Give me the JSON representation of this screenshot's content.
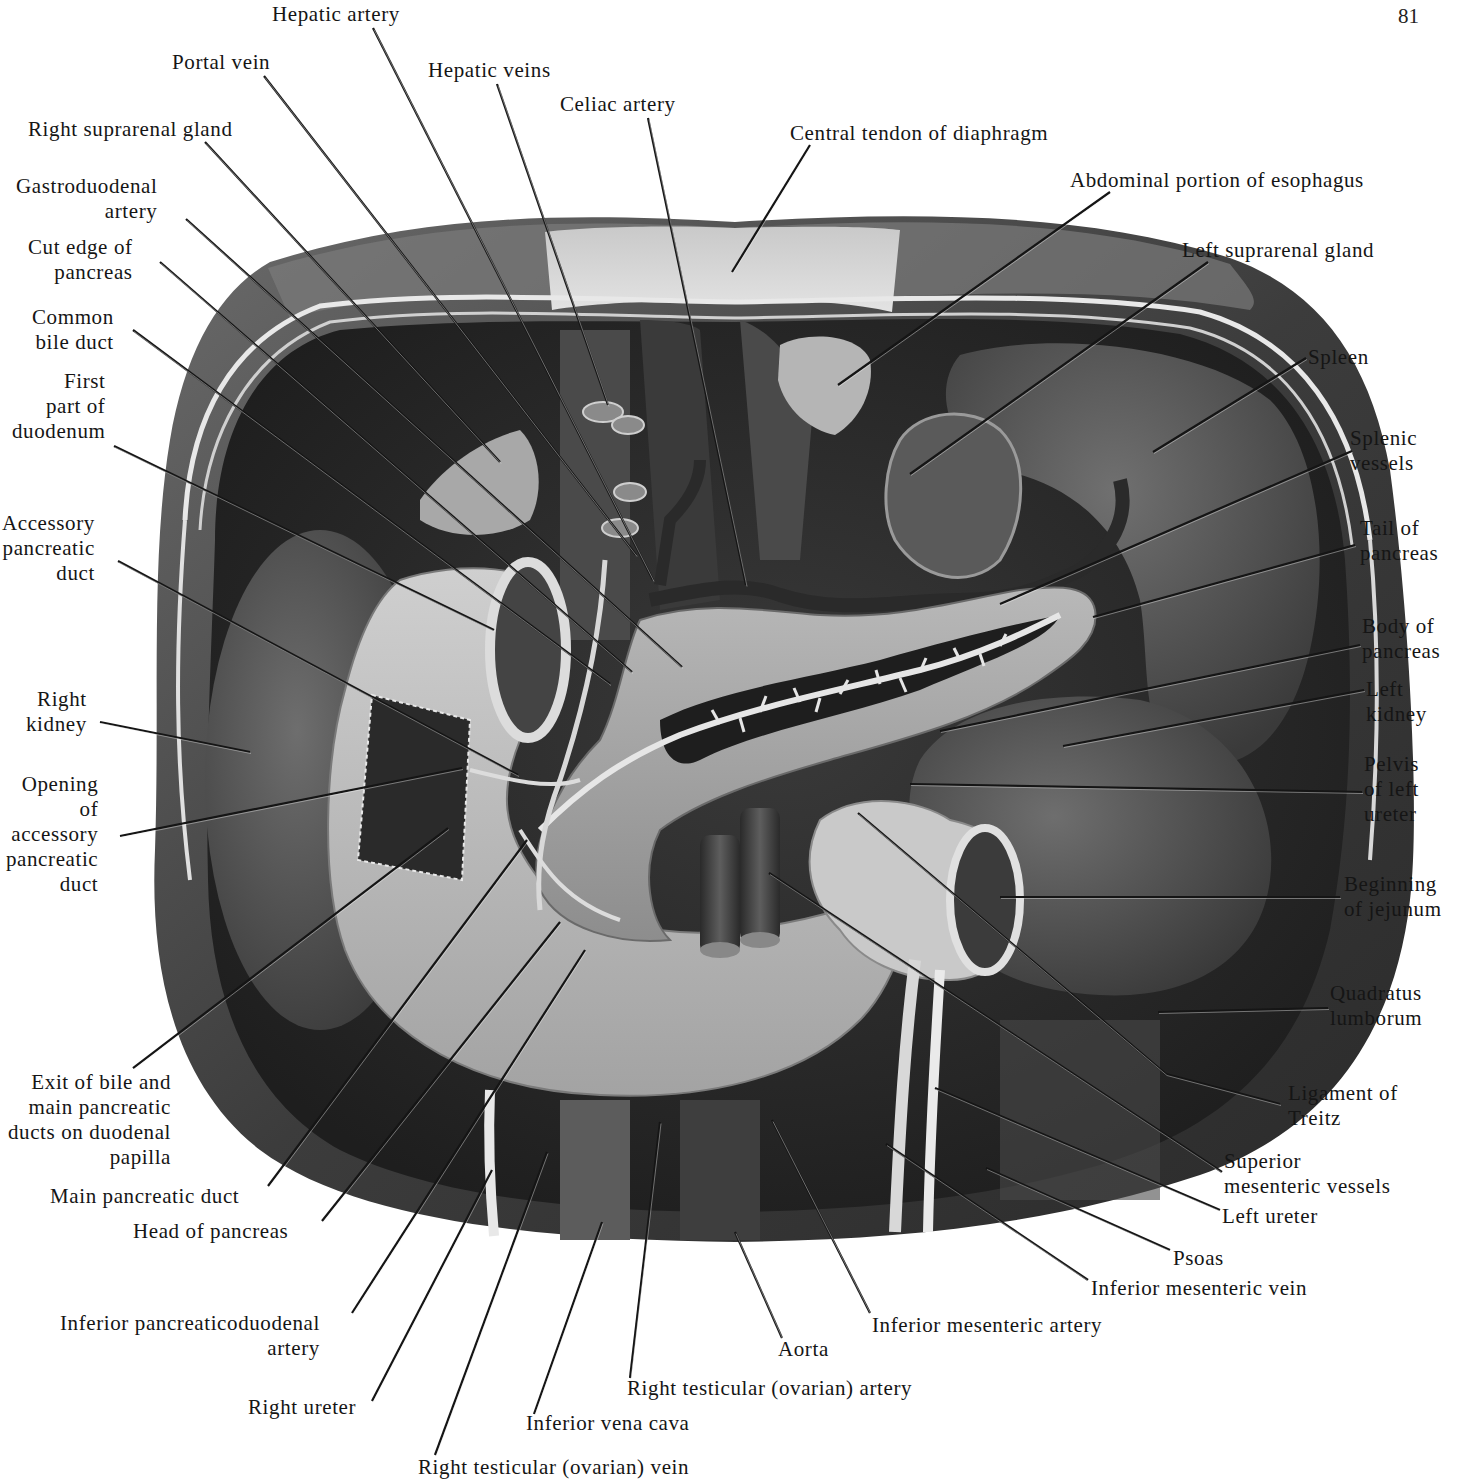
{
  "page": {
    "number": "81"
  },
  "figure": {
    "colors": {
      "ink": "#151515",
      "tissue_dark": "#2b2b2b",
      "tissue_mid": "#5a5a5a",
      "tissue_light": "#bdbdbd",
      "paper": "#ffffff"
    }
  },
  "labels": [
    {
      "id": "hepatic-artery",
      "text": "Hepatic artery",
      "x": 272,
      "y": 2,
      "align": "l",
      "line": [
        [
          373,
          28
        ],
        [
          653,
          580
        ]
      ]
    },
    {
      "id": "portal-vein",
      "text": "Portal vein",
      "x": 172,
      "y": 50,
      "align": "l",
      "line": [
        [
          264,
          76
        ],
        [
          636,
          555
        ]
      ]
    },
    {
      "id": "hepatic-veins",
      "text": "Hepatic veins",
      "x": 428,
      "y": 58,
      "align": "l",
      "line": [
        [
          497,
          84
        ],
        [
          608,
          405
        ]
      ]
    },
    {
      "id": "celiac-artery",
      "text": "Celiac artery",
      "x": 560,
      "y": 92,
      "align": "l",
      "line": [
        [
          648,
          118
        ],
        [
          746,
          585
        ]
      ]
    },
    {
      "id": "central-tendon",
      "text": "Central tendon of diaphragm",
      "x": 790,
      "y": 121,
      "align": "l",
      "line": [
        [
          810,
          145
        ],
        [
          732,
          272
        ]
      ]
    },
    {
      "id": "abdominal-esophagus",
      "text": "Abdominal portion of esophagus",
      "x": 1070,
      "y": 168,
      "align": "l",
      "line": [
        [
          1110,
          192
        ],
        [
          838,
          385
        ]
      ]
    },
    {
      "id": "right-suprarenal",
      "text": "Right suprarenal gland",
      "x": 28,
      "y": 117,
      "align": "l",
      "line": [
        [
          205,
          142
        ],
        [
          500,
          462
        ]
      ]
    },
    {
      "id": "left-suprarenal",
      "text": "Left suprarenal gland",
      "x": 1182,
      "y": 238,
      "align": "l",
      "line": [
        [
          1208,
          262
        ],
        [
          910,
          474
        ]
      ]
    },
    {
      "id": "gastroduodenal-artery",
      "text": "Gastroduodenal\n      artery",
      "x": 16,
      "y": 174,
      "align": "r",
      "line": [
        [
          186,
          219
        ],
        [
          682,
          667
        ]
      ]
    },
    {
      "id": "cut-edge-pancreas",
      "text": "Cut edge of\n  pancreas",
      "x": 28,
      "y": 235,
      "align": "r",
      "line": [
        [
          160,
          262
        ],
        [
          632,
          672
        ]
      ]
    },
    {
      "id": "common-bile-duct",
      "text": "Common\nbile duct",
      "x": 32,
      "y": 305,
      "align": "r",
      "line": [
        [
          133,
          330
        ],
        [
          610,
          684
        ]
      ]
    },
    {
      "id": "first-part-duodenum",
      "text": "First\npart of\nduodenum",
      "x": 12,
      "y": 369,
      "align": "r",
      "line": [
        [
          114,
          446
        ],
        [
          494,
          630
        ]
      ]
    },
    {
      "id": "accessory-pancreatic-duct",
      "text": "Accessory\npancreatic\nduct",
      "x": 2,
      "y": 511,
      "align": "r",
      "line": [
        [
          118,
          561
        ],
        [
          518,
          775
        ]
      ]
    },
    {
      "id": "spleen",
      "text": "Spleen",
      "x": 1308,
      "y": 345,
      "align": "l",
      "line": [
        [
          1306,
          358
        ],
        [
          1153,
          452
        ]
      ]
    },
    {
      "id": "splenic-vessels",
      "text": "Splenic\nvessels",
      "x": 1350,
      "y": 426,
      "align": "l",
      "line": [
        [
          1352,
          451
        ],
        [
          1000,
          604
        ]
      ]
    },
    {
      "id": "tail-of-pancreas",
      "text": "Tail of\npancreas",
      "x": 1360,
      "y": 516,
      "align": "l",
      "line": [
        [
          1355,
          545
        ],
        [
          1093,
          617
        ]
      ]
    },
    {
      "id": "body-of-pancreas",
      "text": "Body of\npancreas",
      "x": 1362,
      "y": 614,
      "align": "l",
      "line": [
        [
          1360,
          645
        ],
        [
          940,
          731
        ]
      ]
    },
    {
      "id": "left-kidney",
      "text": "Left\nkidney",
      "x": 1366,
      "y": 677,
      "align": "l",
      "line": [
        [
          1364,
          690
        ],
        [
          1063,
          746
        ]
      ]
    },
    {
      "id": "right-kidney",
      "text": "Right\nkidney",
      "x": 26,
      "y": 687,
      "align": "r",
      "line": [
        [
          100,
          722
        ],
        [
          250,
          752
        ]
      ]
    },
    {
      "id": "pelvis-left-ureter",
      "text": "Pelvis\nof left\nureter",
      "x": 1364,
      "y": 752,
      "align": "l",
      "line": [
        [
          1362,
          792
        ],
        [
          910,
          784
        ]
      ]
    },
    {
      "id": "opening-accessory-duct",
      "text": "Opening\nof\naccessory\npancreatic\nduct",
      "x": 6,
      "y": 772,
      "align": "r",
      "line": [
        [
          120,
          836
        ],
        [
          462,
          768
        ]
      ]
    },
    {
      "id": "beginning-jejunum",
      "text": "Beginning\nof jejunum",
      "x": 1344,
      "y": 872,
      "align": "l",
      "line": [
        [
          1340,
          897
        ],
        [
          1000,
          897
        ]
      ]
    },
    {
      "id": "quadratus-lumborum",
      "text": "Quadratus\nlumborum",
      "x": 1330,
      "y": 981,
      "align": "l",
      "line": [
        [
          1328,
          1008
        ],
        [
          1158,
          1012
        ]
      ]
    },
    {
      "id": "exit-bile-ducts",
      "text": "Exit of bile and\nmain pancreatic\nducts on duodenal\npapilla",
      "x": 8,
      "y": 1070,
      "align": "r",
      "line": [
        [
          133,
          1068
        ],
        [
          448,
          828
        ]
      ]
    },
    {
      "id": "ligament-of-treitz",
      "text": "Ligament of\nTreitz",
      "x": 1288,
      "y": 1081,
      "align": "l",
      "line": [
        [
          1280,
          1104
        ],
        [
          1166,
          1074
        ],
        [
          858,
          813
        ]
      ]
    },
    {
      "id": "superior-mesenteric-vessels",
      "text": "Superior\nmesenteric vessels",
      "x": 1224,
      "y": 1149,
      "align": "l",
      "line": [
        [
          1222,
          1172
        ],
        [
          769,
          873
        ]
      ]
    },
    {
      "id": "main-pancreatic-duct",
      "text": "Main pancreatic duct",
      "x": 50,
      "y": 1184,
      "align": "l",
      "line": [
        [
          268,
          1186
        ],
        [
          527,
          840
        ]
      ]
    },
    {
      "id": "left-ureter",
      "text": "Left ureter",
      "x": 1222,
      "y": 1204,
      "align": "l",
      "line": [
        [
          1220,
          1210
        ],
        [
          935,
          1088
        ]
      ]
    },
    {
      "id": "head-of-pancreas",
      "text": "Head of pancreas",
      "x": 133,
      "y": 1219,
      "align": "l",
      "line": [
        [
          322,
          1221
        ],
        [
          560,
          922
        ]
      ]
    },
    {
      "id": "psoas",
      "text": "Psoas",
      "x": 1173,
      "y": 1246,
      "align": "l",
      "line": [
        [
          1170,
          1250
        ],
        [
          986,
          1168
        ]
      ]
    },
    {
      "id": "inferior-mesenteric-vein",
      "text": "Inferior mesenteric vein",
      "x": 1091,
      "y": 1276,
      "align": "l",
      "line": [
        [
          1088,
          1280
        ],
        [
          886,
          1144
        ]
      ]
    },
    {
      "id": "inferior-mesenteric-artery",
      "text": "Inferior mesenteric artery",
      "x": 872,
      "y": 1313,
      "align": "l",
      "line": [
        [
          870,
          1313
        ],
        [
          772,
          1120
        ]
      ]
    },
    {
      "id": "inferior-pancreaticoduodenal-artery",
      "text": "Inferior pancreaticoduodenal\n                     artery",
      "x": 60,
      "y": 1311,
      "align": "r",
      "line": [
        [
          352,
          1313
        ],
        [
          585,
          950
        ]
      ]
    },
    {
      "id": "aorta",
      "text": "Aorta",
      "x": 778,
      "y": 1337,
      "align": "l",
      "line": [
        [
          782,
          1338
        ],
        [
          735,
          1232
        ]
      ]
    },
    {
      "id": "right-testicular-artery",
      "text": "Right testicular (ovarian) artery",
      "x": 627,
      "y": 1376,
      "align": "l",
      "line": [
        [
          630,
          1378
        ],
        [
          660,
          1122
        ]
      ]
    },
    {
      "id": "right-ureter",
      "text": "Right ureter",
      "x": 248,
      "y": 1395,
      "align": "l",
      "line": [
        [
          372,
          1401
        ],
        [
          492,
          1170
        ]
      ]
    },
    {
      "id": "inferior-vena-cava",
      "text": "Inferior vena cava",
      "x": 526,
      "y": 1411,
      "align": "l",
      "line": [
        [
          534,
          1414
        ],
        [
          602,
          1222
        ]
      ]
    },
    {
      "id": "right-testicular-vein",
      "text": "Right testicular (ovarian) vein",
      "x": 418,
      "y": 1455,
      "align": "l",
      "line": [
        [
          435,
          1455
        ],
        [
          547,
          1152
        ]
      ]
    }
  ]
}
